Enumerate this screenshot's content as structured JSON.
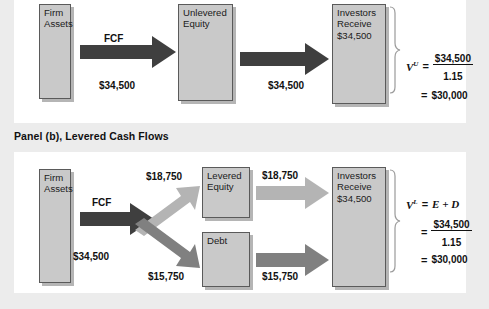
{
  "figure": {
    "panels": [
      {
        "id": "panel-a",
        "label": "",
        "nodes": [
          {
            "name": "firm-assets",
            "lines": [
              "Firm",
              "Assets"
            ]
          },
          {
            "name": "unlevered-equity",
            "lines": [
              "Unlevered",
              "Equity"
            ]
          },
          {
            "name": "investors-receive",
            "lines": [
              "Investors",
              "Receive",
              "$34,500"
            ]
          }
        ],
        "flows": [
          {
            "name": "fcf-label",
            "text": "FCF"
          },
          {
            "name": "fcf-amount",
            "text": "$34,500"
          },
          {
            "name": "equity-to-investors-amount",
            "text": "$34,500"
          }
        ],
        "formula": {
          "variable": "V",
          "superscript": "U",
          "equals": "=",
          "numerator": "$34,500",
          "denominator": "1.15",
          "result_equals": "=",
          "result": "$30,000"
        }
      },
      {
        "id": "panel-b",
        "label": "Panel (b), Levered Cash Flows",
        "nodes": [
          {
            "name": "firm-assets",
            "lines": [
              "Firm",
              "Assets"
            ]
          },
          {
            "name": "levered-equity",
            "lines": [
              "Levered",
              "Equity"
            ]
          },
          {
            "name": "debt",
            "lines": [
              "Debt"
            ]
          },
          {
            "name": "investors-receive",
            "lines": [
              "Investors",
              "Receive",
              "$34,500"
            ]
          }
        ],
        "flows": [
          {
            "name": "fcf-label",
            "text": "FCF"
          },
          {
            "name": "fcf-amount",
            "text": "$34,500"
          },
          {
            "name": "equity-split-amount",
            "text": "$18,750"
          },
          {
            "name": "debt-split-amount",
            "text": "$15,750"
          },
          {
            "name": "equity-to-investors-amount",
            "text": "$18,750"
          },
          {
            "name": "debt-to-investors-amount",
            "text": "$15,750"
          }
        ],
        "formula": {
          "variable": "V",
          "superscript": "L",
          "equals": "=",
          "components": "E + D",
          "second_equals": "=",
          "numerator": "$34,500",
          "denominator": "1.15",
          "result_equals": "=",
          "result": "$30,000"
        }
      }
    ],
    "colors": {
      "background": "#ececec",
      "panel_background": "#ffffff",
      "box_fill": "#c9c9c9",
      "box_border": "#5a5a5a",
      "arrow_dark": "#3f3f3f",
      "arrow_medium": "#808080",
      "arrow_light": "#b4b4b4"
    }
  }
}
